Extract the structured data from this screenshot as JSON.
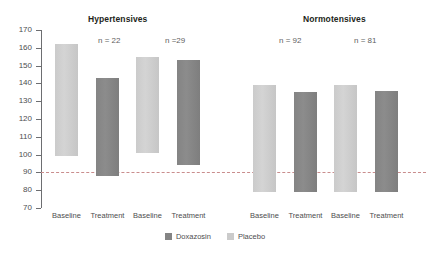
{
  "chart_data": {
    "type": "bar",
    "title": "",
    "subtitle": "",
    "xlabel": "",
    "ylabel": "",
    "ylim": [
      70,
      170
    ],
    "ytick_step": 10,
    "yticks": [
      170,
      160,
      150,
      140,
      130,
      120,
      110,
      100,
      90,
      80,
      70
    ],
    "grid": false,
    "bar_style": "floating range bars (systolic top, diastolic bottom)",
    "reference_line": {
      "value": 90,
      "style": "dashed",
      "color": "#c98d8d"
    },
    "legend": {
      "position": "bottom-center",
      "entries": [
        {
          "name": "Doxazosin",
          "color": "#848484"
        },
        {
          "name": "Placebo",
          "color": "#cbcbcb"
        }
      ]
    },
    "panels": [
      {
        "title": "Hypertensives",
        "groups": [
          {
            "n_label": "n = 22",
            "series": "Doxazosin",
            "bars": [
              {
                "category": "Baseline",
                "fill": "Placebo",
                "top": 162,
                "bottom": 99
              },
              {
                "category": "Treatment",
                "fill": "Doxazosin",
                "top": 143,
                "bottom": 88
              }
            ]
          },
          {
            "n_label": "n =29",
            "series": "Placebo",
            "bars": [
              {
                "category": "Baseline",
                "fill": "Placebo",
                "top": 155,
                "bottom": 101
              },
              {
                "category": "Treatment",
                "fill": "Doxazosin",
                "top": 153,
                "bottom": 94
              }
            ]
          }
        ]
      },
      {
        "title": "Normotensives",
        "groups": [
          {
            "n_label": "n = 92",
            "series": "Doxazosin",
            "bars": [
              {
                "category": "Baseline",
                "fill": "Placebo",
                "top": 139,
                "bottom": 79
              },
              {
                "category": "Treatment",
                "fill": "Doxazosin",
                "top": 135,
                "bottom": 79
              }
            ]
          },
          {
            "n_label": "n = 81",
            "series": "Placebo",
            "bars": [
              {
                "category": "Baseline",
                "fill": "Placebo",
                "top": 139,
                "bottom": 79
              },
              {
                "category": "Treatment",
                "fill": "Doxazosin",
                "top": 136,
                "bottom": 79
              }
            ]
          }
        ]
      }
    ],
    "categories": [
      "Baseline",
      "Treatment",
      "Baseline",
      "Treatment",
      "Baseline",
      "Treatment",
      "Baseline",
      "Treatment"
    ]
  },
  "axis": {
    "ticks": [
      "170",
      "160",
      "150",
      "140",
      "130",
      "120",
      "110",
      "100",
      "90",
      "80",
      "70"
    ]
  },
  "titles": {
    "hypertensives": "Hypertensives",
    "normotensives": "Normotensives"
  },
  "n_labels": {
    "hyper_1": "n = 22",
    "hyper_2": "n =29",
    "normo_1": "n = 92",
    "normo_2": "n = 81"
  },
  "x_labels": [
    "Baseline",
    "Treatment",
    "Baseline",
    "Treatment",
    "Baseline",
    "Treatment",
    "Baseline",
    "Treatment"
  ],
  "legend": {
    "doxazosin": "Doxazosin",
    "placebo": "Placebo"
  }
}
